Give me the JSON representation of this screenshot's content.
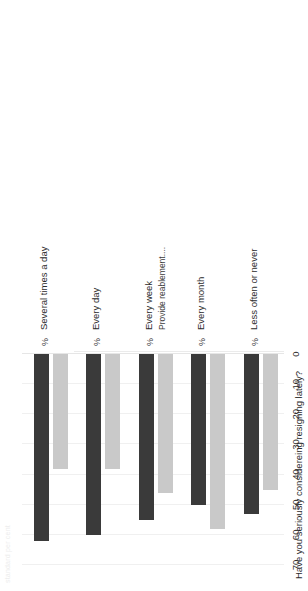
{
  "chart": {
    "faint_note": "standard per cent",
    "value_axis_title": "Have you seriously considereing resigning lately?",
    "category_series_label": "%",
    "category_group_note": "Provide reablement...."
  },
  "chart_data": {
    "type": "bar",
    "orientation": "horizontal",
    "title": "",
    "xlabel": "Have you seriously considereing resigning lately?",
    "ylabel": "",
    "xlim": [
      0,
      70
    ],
    "ticks": [
      0,
      10,
      20,
      30,
      40,
      50,
      60,
      70
    ],
    "grid": true,
    "legend": "none",
    "categories": [
      "Several times a day",
      "Every day",
      "Every week",
      "Every month",
      "Less often or never"
    ],
    "category_sublabel": "Provide reablement....",
    "unit": "%",
    "series": [
      {
        "name": "Yes",
        "color": "#3a3a3a",
        "values": [
          62,
          60,
          55,
          50,
          53
        ]
      },
      {
        "name": "No",
        "color": "#c9c9c9",
        "values": [
          38,
          38,
          46,
          58,
          45
        ]
      }
    ]
  },
  "colors": {
    "dark_bar": "#3a3a3a",
    "light_bar": "#c9c9c9",
    "gridline": "#f0f0f0",
    "text": "#2b2b2b",
    "background": "#ffffff"
  }
}
